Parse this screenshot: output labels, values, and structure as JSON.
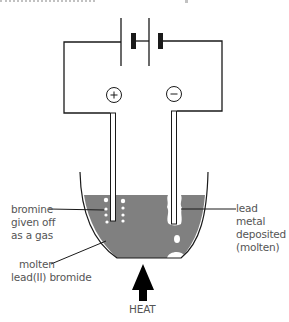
{
  "figure": {
    "type": "electrolysis apparatus diagram",
    "power_source": {
      "component": "battery",
      "cells": 2
    },
    "electrodes": {
      "anode": {
        "symbol": "+",
        "icon": "plus-circle-icon"
      },
      "cathode": {
        "symbol": "−",
        "icon": "minus-circle-icon"
      }
    },
    "labels": {
      "bromine": [
        "bromine",
        "given off",
        "as a gas"
      ],
      "lead": [
        "lead metal",
        "deposited",
        "(molten)"
      ],
      "electrolyte": [
        "molten",
        "lead(II) bromide"
      ],
      "heat": "HEAT"
    },
    "colors": {
      "liquid": "#808080",
      "lines": "#1a1a1a",
      "label_text": "#555555",
      "background": "#ffffff"
    }
  }
}
